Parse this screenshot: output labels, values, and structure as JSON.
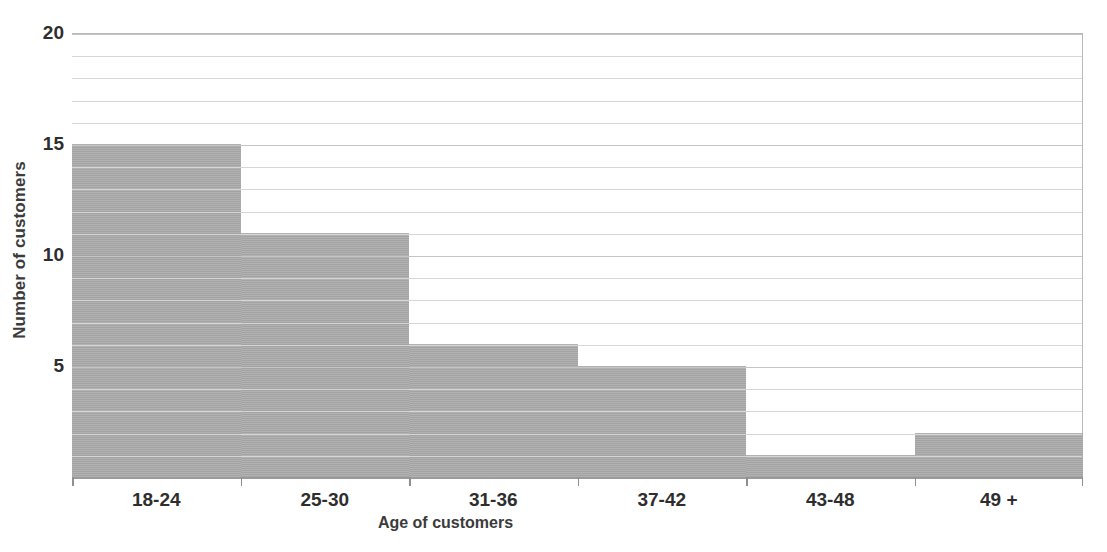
{
  "chart_data": {
    "type": "bar",
    "title": "",
    "subtitle": "",
    "xlabel": "Age of customers",
    "ylabel": "Number of customers",
    "categories": [
      "18-24",
      "25-30",
      "31-36",
      "37-42",
      "43-48",
      "49 +"
    ],
    "values": [
      15,
      11,
      6,
      5,
      1,
      2
    ],
    "ylim": [
      0,
      20
    ],
    "y_tick_labels": [
      "0",
      "5",
      "10",
      "15",
      "20"
    ],
    "y_tick_values": [
      0,
      5,
      10,
      15,
      20
    ],
    "gridlines": "horizontal, every 1 unit",
    "legend": "none",
    "bar_color": "#a9a9a9",
    "grid_color": "#d6d6d6",
    "axis_color": "#9a9a9a",
    "text_color": "#2e2e2e",
    "background": "#ffffff",
    "style": "adjacent histogram bars, no gaps"
  }
}
